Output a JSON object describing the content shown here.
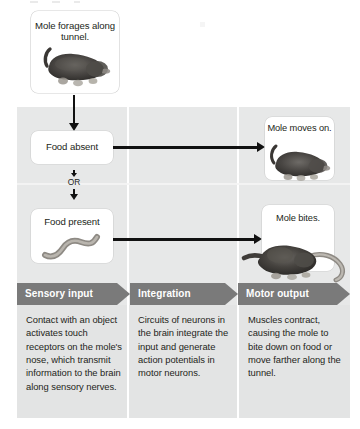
{
  "figure": {
    "name": "mole-foraging-reflex-pathway-diagram",
    "background_color": "#ffffff",
    "band_color": "#e7e8e8",
    "banner_color": "#7a7a7a",
    "banner_text_color": "#ffffff",
    "text_color": "#231f20",
    "arrow_color": "#111111"
  },
  "top": {
    "card_label": "Mole forages along tunnel.",
    "art_name": "mole-illustration"
  },
  "left_column": {
    "food_absent_label": "Food absent",
    "or_label": "OR",
    "food_present_label": "Food present",
    "worm_art_name": "earthworm-illustration"
  },
  "right_column": {
    "moves_on_label": "Mole moves on.",
    "moves_on_art_name": "mole-walking-illustration",
    "bites_label": "Mole bites.",
    "bites_art_name": "mole-biting-worm-illustration"
  },
  "stages": [
    {
      "banner": "Sensory input",
      "description": "Contact with an object activates touch receptors on the mole's nose, which transmit information to the brain along sensory nerves."
    },
    {
      "banner": "Integration",
      "description": "Circuits of neurons in the brain integrate the input and generate action potentials in motor neurons."
    },
    {
      "banner": "Motor output",
      "description": "Muscles contract, causing the mole to bite down on food or move farther along the tunnel."
    }
  ]
}
